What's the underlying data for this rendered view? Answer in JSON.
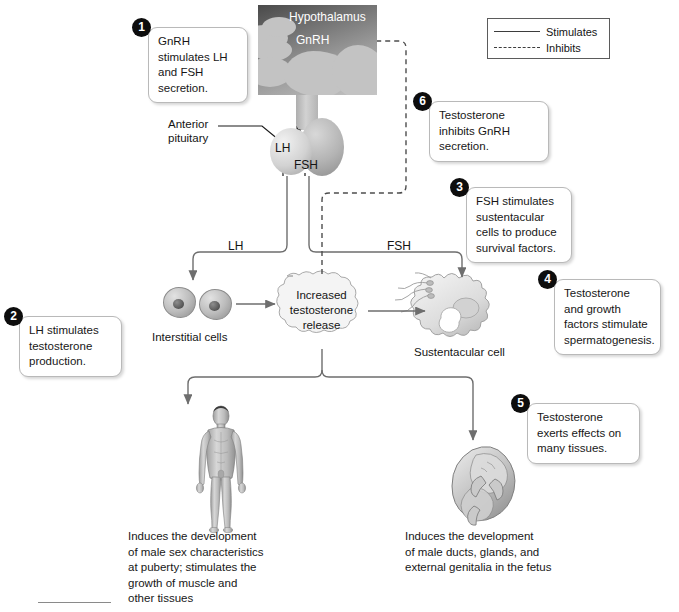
{
  "figure": {
    "domain": "biology-diagram"
  },
  "legend": {
    "items": [
      {
        "label": "Stimulates",
        "style": "solid"
      },
      {
        "label": "Inhibits",
        "style": "dashed"
      }
    ]
  },
  "callouts": [
    {
      "number": "1",
      "text": "GnRH stimulates LH and FSH secretion."
    },
    {
      "number": "2",
      "text": "LH stimulates testosterone production."
    },
    {
      "number": "3",
      "text": "FSH stimulates sustentacular cells to produce survival factors."
    },
    {
      "number": "4",
      "text": "Testosterone and growth factors stimulate spermatogenesis."
    },
    {
      "number": "5",
      "text": "Testosterone exerts effects on many tissues."
    },
    {
      "number": "6",
      "text": "Testosterone inhibits GnRH secretion."
    }
  ],
  "anatomy": {
    "hypothalamus": "Hypothalamus",
    "gnrh": "GnRH",
    "anterior_pituitary": "Anterior\npituitary",
    "anterior_pituitary_line1": "Anterior",
    "anterior_pituitary_line2": "pituitary",
    "lh_pituitary": "LH",
    "fsh_pituitary": "FSH"
  },
  "arrows": {
    "lh": "LH",
    "fsh": "FSH"
  },
  "nodes": {
    "interstitial_cells": "Interstitial cells",
    "sustentacular_cell": "Sustentacular cell",
    "testosterone_cloud_line1": "Increased",
    "testosterone_cloud_line2": "testosterone",
    "testosterone_cloud_line3": "release"
  },
  "captions": {
    "male": "Induces the development of male sex characteristics at puberty; stimulates the growth of muscle and other tissues",
    "male_lines": [
      "Induces the development",
      "of male sex characteristics",
      "at puberty; stimulates the",
      "growth of muscle and",
      "other tissues"
    ],
    "fetus": "Induces the development of male ducts, glands, and external genitalia in the fetus",
    "fetus_lines": [
      "Induces the development",
      "of male ducts, glands, and",
      "external genitalia in the fetus"
    ]
  },
  "colors": {
    "stroke": "#6e6e6e",
    "text": "#141414",
    "badge_bg": "#0d0d0d",
    "badge_text": "#ffffff",
    "callout_border": "#b9b9b9",
    "legend_border": "#5b5b5b",
    "background": "#ffffff"
  }
}
